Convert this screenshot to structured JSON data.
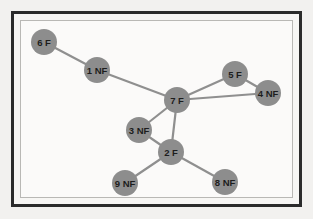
{
  "figure": {
    "type": "node-link-graph",
    "background_color": "#f2f1ef",
    "panel_color": "#fbfaf9",
    "outer_frame_color": "#2b2b2b",
    "inner_frame_color": "#b9b8b5",
    "node_color": "#8d8d8d",
    "edge_color": "#8f8f8f",
    "label_color": "#1d1d1d",
    "node_radius": 13
  },
  "chart_data": {
    "type": "scatter",
    "title": "",
    "xlabel": "",
    "ylabel": "",
    "graph": {
      "node_count": 9,
      "edge_count": 10,
      "nodes": [
        {
          "id": "1",
          "label": "1 NF",
          "state": "NF",
          "x": 97,
          "y": 70
        },
        {
          "id": "2",
          "label": "2 F",
          "state": "F",
          "x": 171,
          "y": 152
        },
        {
          "id": "3",
          "label": "3 NF",
          "state": "NF",
          "x": 139,
          "y": 130
        },
        {
          "id": "4",
          "label": "4 NF",
          "state": "NF",
          "x": 268,
          "y": 93
        },
        {
          "id": "5",
          "label": "5 F",
          "state": "F",
          "x": 235,
          "y": 74
        },
        {
          "id": "6",
          "label": "6 F",
          "state": "F",
          "x": 44,
          "y": 42
        },
        {
          "id": "7",
          "label": "7 F",
          "state": "F",
          "x": 177,
          "y": 100
        },
        {
          "id": "8",
          "label": "8 NF",
          "state": "NF",
          "x": 225,
          "y": 182
        },
        {
          "id": "9",
          "label": "9 NF",
          "state": "NF",
          "x": 125,
          "y": 183
        }
      ],
      "edges": [
        {
          "source": "6",
          "target": "1"
        },
        {
          "source": "1",
          "target": "7"
        },
        {
          "source": "7",
          "target": "5"
        },
        {
          "source": "7",
          "target": "4"
        },
        {
          "source": "5",
          "target": "4"
        },
        {
          "source": "7",
          "target": "3"
        },
        {
          "source": "7",
          "target": "2"
        },
        {
          "source": "3",
          "target": "2"
        },
        {
          "source": "2",
          "target": "9"
        },
        {
          "source": "2",
          "target": "8"
        }
      ]
    }
  }
}
